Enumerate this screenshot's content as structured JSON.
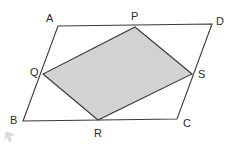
{
  "figure": {
    "type": "geometry-diagram",
    "background_color": "#ffffff",
    "stroke_color": "#3a3a3a",
    "shaded_fill_color": "#d2d2d2",
    "stroke_width": 1.1,
    "outer_shape": {
      "name": "parallelogram-abcd",
      "vertices": [
        {
          "label": "A",
          "x": 58,
          "y": 26,
          "label_x": 46,
          "label_y": 13
        },
        {
          "label": "D",
          "x": 212,
          "y": 24,
          "label_x": 216,
          "label_y": 16
        },
        {
          "label": "C",
          "x": 177,
          "y": 119,
          "label_x": 183,
          "label_y": 118
        },
        {
          "label": "B",
          "x": 23,
          "y": 121,
          "label_x": 10,
          "label_y": 115
        }
      ],
      "points_string": "58,26 212,24 177,119 23,121"
    },
    "inner_shape": {
      "name": "quadrilateral-pqrs",
      "vertices": [
        {
          "label": "P",
          "x": 135,
          "y": 27,
          "label_x": 131,
          "label_y": 11
        },
        {
          "label": "S",
          "x": 192,
          "y": 74,
          "label_x": 198,
          "label_y": 69
        },
        {
          "label": "R",
          "x": 98,
          "y": 120,
          "label_x": 94,
          "label_y": 128
        },
        {
          "label": "Q",
          "x": 43,
          "y": 74,
          "label_x": 30,
          "label_y": 67
        }
      ],
      "points_string": "135,27 192,74 98,120 43,74"
    },
    "cursor_artifact": {
      "name": "cursor-arrow-artifact",
      "x": 3,
      "y": 131,
      "color": "#b9b9b9"
    }
  }
}
